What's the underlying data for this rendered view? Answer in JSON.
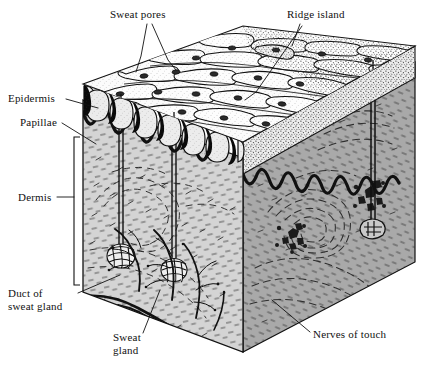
{
  "figure": {
    "type": "anatomical-cutaway-illustration",
    "background_color": "#ffffff",
    "ink_color": "#111111",
    "width": 434,
    "height": 373
  },
  "labels": [
    {
      "id": "sweat-pores",
      "text": "Sweat pores",
      "x": 110,
      "y": 18,
      "anchor": "start",
      "lines": [
        "Sweat pores"
      ]
    },
    {
      "id": "ridge-island",
      "text": "Ridge island",
      "x": 287,
      "y": 18,
      "anchor": "start",
      "lines": [
        "Ridge island"
      ]
    },
    {
      "id": "epidermis",
      "text": "Epidermis",
      "x": 8,
      "y": 102,
      "anchor": "start",
      "lines": [
        "Epidermis"
      ]
    },
    {
      "id": "papillae",
      "text": "Papillae",
      "x": 20,
      "y": 126,
      "anchor": "start",
      "lines": [
        "Papillae"
      ]
    },
    {
      "id": "dermis",
      "text": "Dermis",
      "x": 18,
      "y": 201,
      "anchor": "start",
      "lines": [
        "Dermis"
      ]
    },
    {
      "id": "duct-of-sweat-gland",
      "text": "Duct of sweat gland",
      "x": 8,
      "y": 297,
      "anchor": "start",
      "lines": [
        "Duct of",
        "sweat gland"
      ]
    },
    {
      "id": "sweat-gland",
      "text": "Sweat gland",
      "x": 113,
      "y": 341,
      "anchor": "start",
      "lines": [
        "Sweat",
        "gland"
      ]
    },
    {
      "id": "nerves-of-touch",
      "text": "Nerves of touch",
      "x": 313,
      "y": 338,
      "anchor": "start",
      "lines": [
        "Nerves of touch"
      ]
    }
  ],
  "structures": [
    {
      "id": "friction-ridges",
      "name": "Friction ridges on epidermal surface",
      "region": "top-face"
    },
    {
      "id": "sweat-pore-openings",
      "name": "Sweat pore openings along ridge crests",
      "region": "top-face"
    },
    {
      "id": "ridge-island-feature",
      "name": "Short ridge island between ridges",
      "region": "top-face"
    },
    {
      "id": "epidermis-layer",
      "name": "Epidermis",
      "region": "front-face-upper"
    },
    {
      "id": "papillae-layer",
      "name": "Dermal papillae (wavy dermo-epidermal junction)",
      "region": "front-face-upper"
    },
    {
      "id": "dermis-layer",
      "name": "Dermis",
      "region": "front-face-lower"
    },
    {
      "id": "sweat-gland-coil-left",
      "name": "Coiled sweat gland",
      "region": "front-face-lower"
    },
    {
      "id": "sweat-gland-coil-right",
      "name": "Coiled sweat gland",
      "region": "front-face-lower"
    },
    {
      "id": "sweat-duct",
      "name": "Spiral duct of sweat gland",
      "region": "front-face"
    },
    {
      "id": "nerve-branches",
      "name": "Branching nerves of touch",
      "region": "front-face-lower"
    },
    {
      "id": "nerve-endings-right",
      "name": "Nerve end organs / corpuscles",
      "region": "right-face"
    }
  ],
  "palette": {
    "paper": "#ffffff",
    "epidermis_fill": "#e9e9e9",
    "dermis_front_fill": "#d2d2d2",
    "dermis_right_fill": "#a8a8a8",
    "top_face_fill": "#f6f6f6",
    "ink": "#111111",
    "stipple": "#4a4a4a"
  }
}
